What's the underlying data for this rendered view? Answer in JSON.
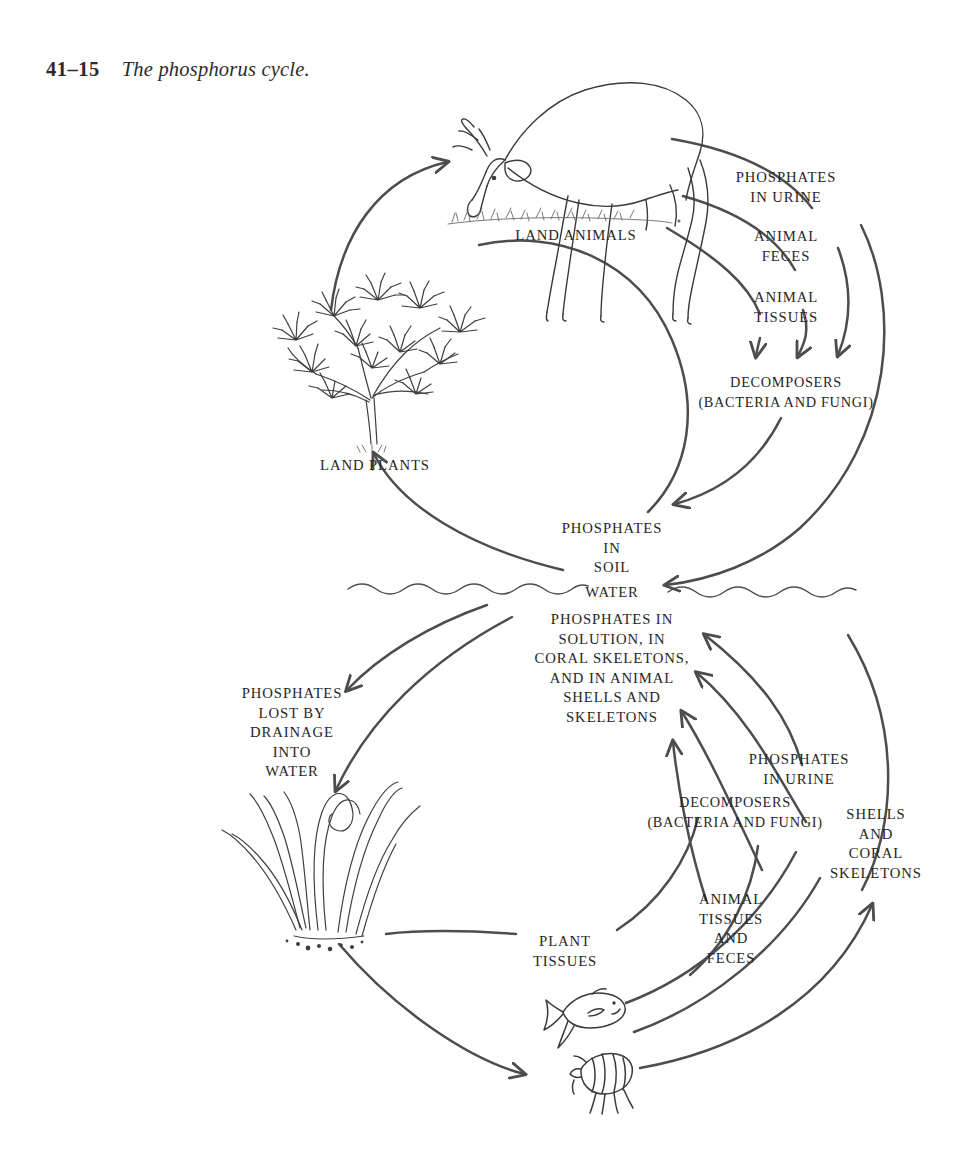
{
  "figure": {
    "number": "41–15",
    "caption": "The phosphorus cycle.",
    "line_color": "#4d4d4d",
    "text_color": "#262626",
    "background": "#ffffff"
  },
  "terrestrial": {
    "land_animals": "LAND ANIMALS",
    "land_plants": "LAND PLANTS",
    "phosphates_in_urine": "PHOSPHATES\nIN URINE",
    "animal_feces": "ANIMAL\nFECES",
    "animal_tissues": "ANIMAL\nTISSUES",
    "decomposers": "DECOMPOSERS\n(BACTERIA AND FUNGI)",
    "phosphates_in_soil": "PHOSPHATES\nIN\nSOIL"
  },
  "boundary": {
    "water": "WATER"
  },
  "aquatic": {
    "phosphates_in_solution": "PHOSPHATES IN\nSOLUTION, IN\nCORAL SKELETONS,\nAND IN ANIMAL\nSHELLS AND\nSKELETONS",
    "phosphates_lost": "PHOSPHATES\nLOST BY\nDRAINAGE\nINTO\nWATER",
    "phosphates_in_urine": "PHOSPHATES\nIN URINE",
    "decomposers": "DECOMPOSERS\n(BACTERIA AND FUNGI)",
    "shells_and_coral": "SHELLS\nAND\nCORAL\nSKELETONS",
    "plant_tissues": "PLANT\nTISSUES",
    "animal_tissues_feces": "ANIMAL\nTISSUES\nAND\nFECES"
  },
  "illustrations": {
    "deer": "deer-grazing-illustration",
    "shrub": "shrub-illustration",
    "seaweed": "aquatic-plants-illustration",
    "fish": "fish-illustration",
    "crustacean": "crustacean-illustration",
    "grass": "grass-tuft-illustration",
    "water_line": "water-surface-wavy-line"
  }
}
